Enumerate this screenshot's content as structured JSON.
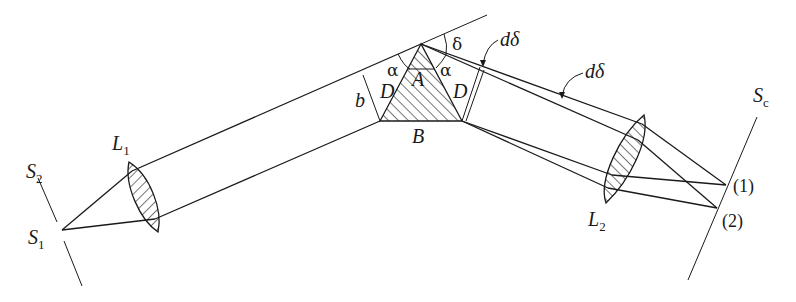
{
  "figure": {
    "labels": {
      "S2": {
        "main": "S",
        "sub": "2"
      },
      "S1": {
        "main": "S",
        "sub": "1"
      },
      "L1": {
        "main": "L",
        "sub": "1"
      },
      "L2": {
        "main": "L",
        "sub": "2"
      },
      "Sc": {
        "main": "S",
        "sub": "c"
      },
      "b": "b",
      "D_left": "D",
      "D_right": "D",
      "A": "A",
      "B": "B",
      "alpha_left": "α",
      "alpha_right": "α",
      "delta": "δ",
      "d_delta_1": "dδ",
      "d_delta_2": "dδ",
      "point_1": "(1)",
      "point_2": "(2)"
    }
  }
}
